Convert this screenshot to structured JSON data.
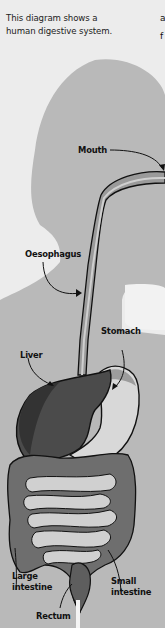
{
  "caption": {
    "line1": "This diagram shows a",
    "line2": "human digestive system."
  },
  "clipped_text": {
    "line1": "a",
    "line2": "f"
  },
  "labels": {
    "mouth": "Mouth",
    "oesophagus": "Oesophagus",
    "stomach": "Stomach",
    "liver": "Liver",
    "large_intestine_1": "Large",
    "large_intestine_2": "intestine",
    "small_intestine_1": "Small",
    "small_intestine_2": "intestine",
    "rectum": "Rectum"
  },
  "colors": {
    "background": "#ececec",
    "silhouette": "#b8b8b8",
    "liver": "#4a4a4a",
    "large_intestine": "#707070",
    "small_intestine": "#cfcfcf",
    "stomach": "#d6d6d6",
    "outline": "#111111"
  }
}
